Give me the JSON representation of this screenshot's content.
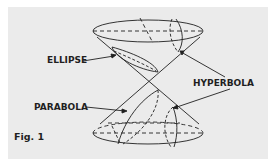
{
  "figure": {
    "caption": "Fig. 1",
    "labels": {
      "ellipse": "ELLIPSE",
      "hyperbola": "HYPERBOLA",
      "parabola": "PARABOLA"
    },
    "colors": {
      "background": "#ebebeb",
      "ink": "#1f1f1f"
    }
  }
}
